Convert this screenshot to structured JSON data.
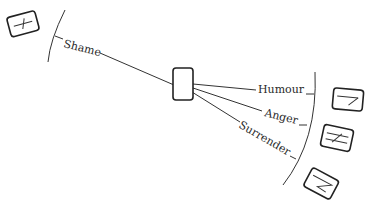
{
  "diagram": {
    "center_node": {
      "label": ""
    },
    "branches": [
      {
        "label": "Shame",
        "icon": "crossed-line-icon"
      },
      {
        "label": "Humour",
        "icon": "line-with-angle-icon"
      },
      {
        "label": "Anger",
        "icon": "double-line-crossed-icon"
      },
      {
        "label": "Surrender",
        "icon": "zigzag-line-icon"
      }
    ],
    "colors": {
      "stroke": "#333333",
      "background": "#ffffff"
    }
  }
}
